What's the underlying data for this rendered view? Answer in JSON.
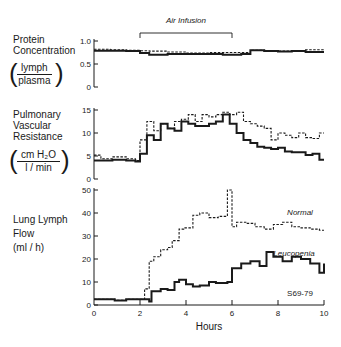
{
  "chart_data": [
    {
      "type": "line",
      "panel": "top",
      "title": "Protein Concentration (lymph/plasma)",
      "ylabel_lines": [
        "Protein",
        "Concentration"
      ],
      "units": {
        "num": "lymph",
        "den": "plasma"
      },
      "xlabel": "Hours",
      "xlim": [
        0,
        10
      ],
      "ylim": [
        0,
        1.0
      ],
      "yticks": [
        "0",
        "0.5",
        "1.0"
      ],
      "step": true,
      "series": [
        {
          "name": "Normal",
          "style": "dashed",
          "x": [
            0,
            0.7,
            1.4,
            2.0,
            2.4,
            3.2,
            4.0,
            5.0,
            5.6,
            6.4,
            6.8,
            7.4,
            8.0,
            8.6,
            9.2,
            10
          ],
          "values": [
            0.82,
            0.81,
            0.8,
            0.79,
            0.78,
            0.76,
            0.74,
            0.75,
            0.75,
            0.75,
            0.8,
            0.79,
            0.78,
            0.79,
            0.81
          ]
        },
        {
          "name": "Leucopenia",
          "style": "solid",
          "x": [
            0,
            0.7,
            1.4,
            2.0,
            2.4,
            3.2,
            4.0,
            5.0,
            5.6,
            6.4,
            6.8,
            7.4,
            8.0,
            8.6,
            9.2,
            10
          ],
          "values": [
            0.79,
            0.79,
            0.78,
            0.74,
            0.7,
            0.72,
            0.72,
            0.72,
            0.7,
            0.72,
            0.8,
            0.78,
            0.77,
            0.78,
            0.76
          ]
        }
      ]
    },
    {
      "type": "line",
      "panel": "middle",
      "title": "Pulmonary Vascular Resistance (cm H2O / l/min)",
      "ylabel_lines": [
        "Pulmonary",
        "Vascular",
        "Resistance"
      ],
      "units": {
        "num": "cm H₂O",
        "den": "l / min"
      },
      "xlabel": "Hours",
      "xlim": [
        0,
        10
      ],
      "ylim": [
        0,
        15
      ],
      "yticks": [
        "0",
        "5",
        "10",
        "15"
      ],
      "step": true,
      "series": [
        {
          "name": "Normal",
          "style": "dashed",
          "x": [
            0,
            0.3,
            0.8,
            1.4,
            1.8,
            2.0,
            2.3,
            2.6,
            2.9,
            3.2,
            3.5,
            3.8,
            4.1,
            4.4,
            4.7,
            5.0,
            5.3,
            5.6,
            5.9,
            6.2,
            6.5,
            6.8,
            7.1,
            7.4,
            7.7,
            8.0,
            8.3,
            8.6,
            8.9,
            9.2,
            9.5,
            9.8,
            10
          ],
          "values": [
            5.2,
            4.4,
            4.8,
            4.4,
            4.0,
            8.5,
            12.5,
            10.5,
            12.0,
            11.0,
            12.5,
            13.0,
            14.0,
            12.5,
            14.0,
            13.5,
            14.0,
            14.5,
            14.0,
            14.5,
            12.5,
            12.0,
            11.5,
            11.0,
            8.5,
            10.0,
            9.5,
            9.0,
            10.0,
            9.0,
            8.8,
            10.0
          ]
        },
        {
          "name": "Leucopenia",
          "style": "solid",
          "x": [
            0,
            0.3,
            0.8,
            1.4,
            1.8,
            2.0,
            2.3,
            2.6,
            2.9,
            3.2,
            3.5,
            3.8,
            4.1,
            4.4,
            4.7,
            5.0,
            5.3,
            5.6,
            5.9,
            6.2,
            6.5,
            6.8,
            7.1,
            7.4,
            7.7,
            8.0,
            8.3,
            8.6,
            8.9,
            9.2,
            9.5,
            9.8,
            10
          ],
          "values": [
            4.0,
            4.0,
            4.2,
            4.0,
            3.8,
            5.5,
            9.5,
            8.5,
            12.0,
            11.0,
            10.5,
            12.5,
            12.0,
            11.5,
            11.5,
            12.0,
            12.5,
            14.0,
            12.0,
            10.0,
            8.5,
            7.8,
            7.0,
            6.8,
            6.5,
            6.8,
            6.0,
            5.8,
            5.8,
            5.2,
            5.5,
            4.2
          ]
        }
      ]
    },
    {
      "type": "line",
      "panel": "bottom",
      "title": "Lung Lymph Flow (ml/h)",
      "ylabel_lines": [
        "Lung Lymph",
        "Flow",
        "(ml / h)"
      ],
      "xlabel": "Hours",
      "xlim": [
        0,
        10
      ],
      "ylim": [
        0,
        50
      ],
      "xticks": [
        "0",
        "2",
        "4",
        "6",
        "8",
        "10"
      ],
      "yticks": [
        "0",
        "10",
        "20",
        "30",
        "40",
        "50"
      ],
      "step": true,
      "series": [
        {
          "name": "Normal",
          "style": "dashed",
          "x": [
            0,
            0.9,
            1.4,
            2.1,
            2.2,
            2.4,
            2.6,
            2.9,
            3.2,
            3.4,
            3.7,
            3.9,
            4.3,
            4.6,
            5.0,
            5.4,
            5.8,
            6.0,
            6.2,
            6.6,
            7.0,
            7.4,
            7.8,
            8.2,
            8.6,
            9.0,
            9.4,
            9.8,
            10
          ],
          "values": [
            2.5,
            2.0,
            2.5,
            2.5,
            7.0,
            19.0,
            21.0,
            24.0,
            25.0,
            28.0,
            33.0,
            33.5,
            39.0,
            40.0,
            38.0,
            38.5,
            50.0,
            34.0,
            36.0,
            35.5,
            34.0,
            33.0,
            35.0,
            36.0,
            34.0,
            33.5,
            33.0,
            32.5
          ]
        },
        {
          "name": "Leucopenia",
          "style": "solid",
          "x": [
            0,
            0.9,
            1.4,
            2.0,
            2.4,
            2.5,
            2.9,
            3.2,
            3.5,
            3.7,
            4.0,
            4.3,
            4.6,
            5.0,
            5.3,
            5.8,
            6.0,
            6.4,
            6.8,
            7.2,
            7.5,
            7.8,
            8.2,
            8.6,
            9.0,
            9.4,
            9.8,
            10
          ],
          "values": [
            2.5,
            2.0,
            2.5,
            2.5,
            1.5,
            6.0,
            7.0,
            6.5,
            10.0,
            11.0,
            9.0,
            8.0,
            8.5,
            10.0,
            9.5,
            10.0,
            16.0,
            18.0,
            19.0,
            17.0,
            23.0,
            21.0,
            19.0,
            21.0,
            20.0,
            18.0,
            14.0,
            18.0
          ]
        }
      ]
    }
  ],
  "annotations": {
    "air_infusion": "Air Infusion",
    "air_infusion_span_hours": [
      2,
      6
    ],
    "normal_label": "Normal",
    "leucopenia_label": "Leucopenia",
    "figure_id": "S69-79",
    "xlabel": "Hours"
  },
  "labels": {
    "protein_1": "Protein",
    "protein_2": "Concentration",
    "protein_num": "lymph",
    "protein_den": "plasma",
    "pvr_1": "Pulmonary",
    "pvr_2": "Vascular",
    "pvr_3": "Resistance",
    "pvr_num": "cm H₂O",
    "pvr_den": "l / min",
    "llf_1": "Lung Lymph",
    "llf_2": "Flow",
    "llf_3": "(ml / h)"
  }
}
